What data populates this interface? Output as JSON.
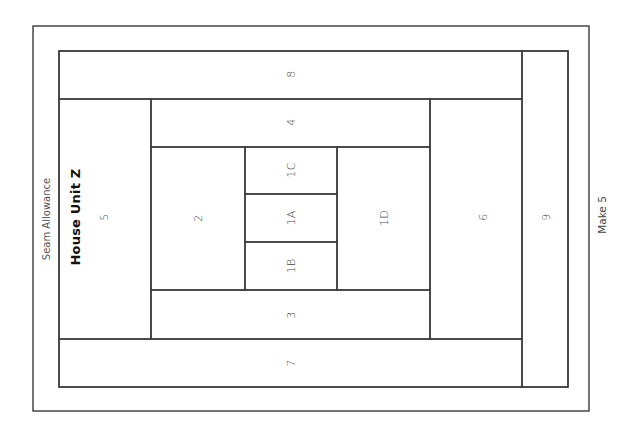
{
  "diagram": {
    "title": "House Unit Z",
    "seam_allowance_label": "Seam Allowance",
    "make_label": "Make 5",
    "line_color": "#3a3a3a",
    "pieces": [
      {
        "label": "8"
      },
      {
        "label": "9"
      },
      {
        "label": "5"
      },
      {
        "label": "4"
      },
      {
        "label": "2"
      },
      {
        "label": "1C"
      },
      {
        "label": "1A"
      },
      {
        "label": "1B"
      },
      {
        "label": "1D"
      },
      {
        "label": "3"
      },
      {
        "label": "6"
      },
      {
        "label": "7"
      }
    ]
  }
}
